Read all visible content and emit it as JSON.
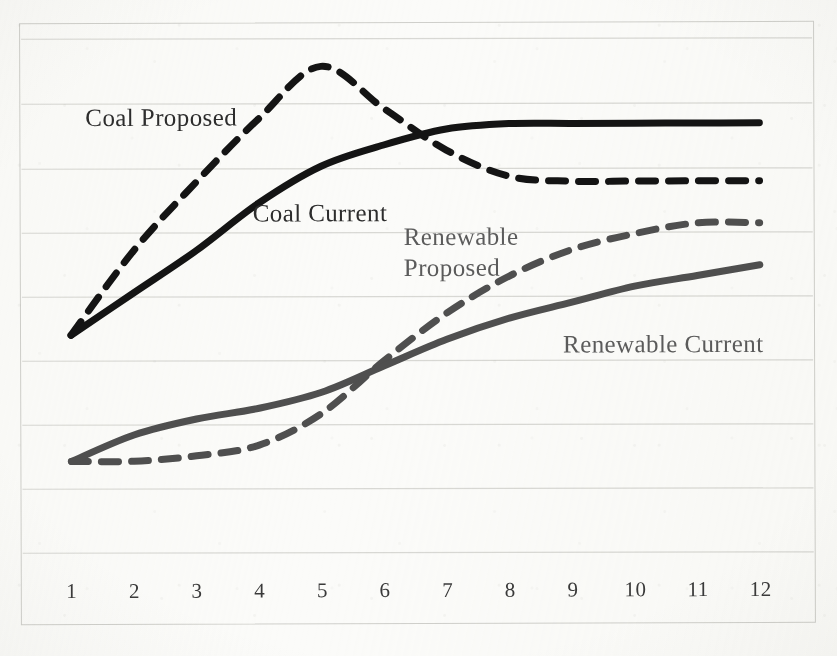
{
  "figure": {
    "kind": "scanned-line-chart",
    "background_color": "#fbfbf9",
    "frame_color": "#cfcfcb",
    "gridline_color": "#d8d8d4"
  },
  "chart_data": {
    "type": "line",
    "title": "",
    "subtitle": "",
    "xlabel": "",
    "ylabel": "",
    "grid": "horizontal",
    "legend_position": "inline-annotations",
    "x_tick_labels": [
      "1",
      "2",
      "3",
      "4",
      "5",
      "6",
      "7",
      "8",
      "9",
      "10",
      "11",
      "12"
    ],
    "x": [
      1,
      2,
      3,
      4,
      5,
      6,
      7,
      8,
      9,
      10,
      11,
      12
    ],
    "xlim": [
      1,
      12
    ],
    "ylim": [
      0,
      100
    ],
    "y_axis_ticks_labeled": false,
    "gridline_count": 9,
    "series": [
      {
        "name": "Coal Proposed",
        "style": "dashed",
        "color": "#141414",
        "width": 7,
        "values": [
          46,
          62,
          75,
          87,
          97,
          89,
          81,
          76,
          75,
          75,
          75,
          75
        ]
      },
      {
        "name": "Coal Current",
        "style": "solid",
        "color": "#141414",
        "width": 7,
        "values": [
          46,
          54,
          62,
          71,
          78,
          82,
          85,
          86,
          86,
          86,
          86,
          86
        ]
      },
      {
        "name": "Renewable Proposed",
        "style": "dashed",
        "color": "#4f4f4f",
        "width": 7,
        "values": [
          22,
          22,
          23,
          25,
          31,
          41,
          50,
          57,
          62,
          65,
          67,
          67
        ]
      },
      {
        "name": "Renewable Current",
        "style": "solid",
        "color": "#4f4f4f",
        "width": 7,
        "values": [
          22,
          27,
          30,
          32,
          35,
          40,
          45,
          49,
          52,
          55,
          57,
          59
        ]
      }
    ],
    "annotations": [
      {
        "id": "coal-proposed",
        "text": "Coal Proposed",
        "line1": "Coal Proposed",
        "line2": "",
        "color": "#2d2d2d",
        "x_px": 86,
        "y_px": 102,
        "font_px": 25
      },
      {
        "id": "coal-current",
        "text": "Coal Current",
        "line1": "Coal Current",
        "line2": "",
        "color": "#2d2d2d",
        "x_px": 253,
        "y_px": 198,
        "font_px": 25
      },
      {
        "id": "renewable-proposed",
        "text": "Renewable Proposed",
        "line1": "Renewable",
        "line2": "Proposed",
        "color": "#5b5b5b",
        "x_px": 404,
        "y_px": 222,
        "font_px": 25
      },
      {
        "id": "renewable-current",
        "text": "Renewable Current",
        "line1": "Renewable Current",
        "line2": "",
        "color": "#5b5b5b",
        "x_px": 563,
        "y_px": 330,
        "font_px": 25
      }
    ]
  }
}
